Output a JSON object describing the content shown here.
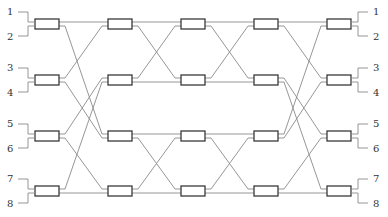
{
  "diagram": {
    "type": "benes-switching-network",
    "input_labels": [
      "1",
      "2",
      "3",
      "4",
      "5",
      "6",
      "7",
      "8"
    ],
    "output_labels": [
      "1",
      "2",
      "3",
      "4",
      "5",
      "6",
      "7",
      "8"
    ],
    "stages": 5,
    "switches_per_stage": 4,
    "colors": {
      "wire": "#8a8a8a",
      "box_stroke": "#3a3a3a",
      "text": "#333333"
    }
  }
}
